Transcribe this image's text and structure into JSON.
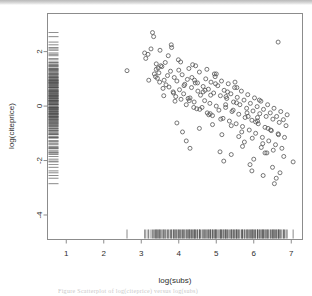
{
  "figure": {
    "kind": "scatterplot-with-rugs",
    "background": "#ffffff",
    "frame_color": "#808080",
    "point_color": "#555555",
    "rug_color": "#4a4a4a",
    "caption_text": "Figure    Scatterplot of log(citeprice) versus log(subs)"
  },
  "chart_data": {
    "type": "scatter",
    "title": "",
    "xlabel": "log(subs)",
    "ylabel": "log(citeprice)",
    "xlim": [
      0.5,
      7.3
    ],
    "ylim": [
      -4.9,
      3.4
    ],
    "xticks": [
      1,
      2,
      3,
      4,
      5,
      6,
      7
    ],
    "xtick_labels": [
      "1",
      "2",
      "3",
      "4",
      "5",
      "6",
      "7"
    ],
    "yticks": [
      2,
      0,
      -2,
      -4
    ],
    "ytick_labels": [
      "2",
      "0",
      "-2",
      "-4"
    ],
    "grid": false,
    "legend": false,
    "marker": "open-circle",
    "marker_size": 3,
    "series": [
      {
        "name": "journals",
        "x": [
          3.3,
          3.4,
          3.52,
          2.62,
          3.09,
          3.18,
          3.33,
          3.35,
          3.38,
          3.4,
          3.43,
          3.47,
          3.49,
          3.55,
          3.61,
          3.64,
          3.66,
          3.7,
          3.74,
          3.78,
          3.81,
          3.85,
          3.88,
          3.92,
          3.95,
          3.99,
          4.02,
          4.06,
          4.09,
          4.13,
          4.16,
          4.2,
          4.23,
          4.27,
          4.3,
          4.34,
          4.37,
          4.41,
          4.44,
          4.48,
          4.51,
          4.55,
          4.58,
          4.62,
          4.65,
          4.69,
          4.72,
          4.76,
          4.79,
          4.83,
          4.86,
          4.9,
          4.93,
          4.97,
          5.0,
          5.04,
          5.07,
          5.11,
          5.14,
          5.18,
          5.21,
          5.25,
          5.28,
          5.32,
          5.35,
          5.39,
          5.42,
          5.46,
          5.49,
          5.53,
          5.56,
          5.6,
          5.63,
          5.67,
          5.7,
          5.74,
          5.77,
          5.81,
          5.84,
          5.88,
          5.91,
          5.95,
          5.98,
          6.02,
          6.05,
          6.09,
          6.12,
          6.16,
          6.19,
          6.23,
          6.26,
          6.3,
          6.33,
          6.37,
          6.4,
          6.44,
          6.47,
          6.51,
          6.54,
          6.58,
          6.61,
          6.65,
          6.68,
          6.72,
          6.75,
          6.79,
          6.82,
          6.86,
          6.89,
          7.05,
          3.12,
          3.26,
          3.45,
          3.58,
          3.72,
          3.86,
          4.0,
          4.14,
          4.28,
          4.42,
          4.56,
          4.7,
          4.84,
          4.98,
          5.12,
          5.26,
          5.4,
          5.54,
          5.68,
          5.82,
          5.96,
          6.1,
          6.24,
          6.38,
          6.52,
          6.66,
          6.8,
          4.05,
          4.35,
          4.65,
          4.95,
          5.25,
          5.55,
          5.85,
          6.15,
          6.45,
          3.95,
          4.25,
          4.55,
          4.85,
          5.15,
          5.45,
          5.75,
          6.05,
          6.35,
          6.65,
          3.2,
          3.6,
          4.1,
          4.5,
          4.9,
          5.3,
          5.7,
          6.1,
          6.5,
          3.8,
          4.4,
          5.0,
          5.6,
          6.2,
          6.7,
          4.2,
          4.8,
          5.4,
          6.0,
          6.6,
          3.5,
          4.3,
          5.1,
          5.9,
          6.55,
          4.45,
          5.2,
          5.95,
          6.3,
          3.9,
          4.75,
          5.5,
          6.25
        ],
        "y": [
          2.7,
          1.55,
          1.48,
          1.3,
          1.95,
          1.9,
          2.55,
          1.18,
          1.08,
          1.35,
          1.02,
          1.22,
          0.88,
          1.45,
          0.95,
          1.6,
          0.78,
          1.12,
          0.7,
          1.28,
          2.15,
          0.52,
          1.05,
          0.35,
          0.92,
          1.7,
          0.6,
          0.25,
          1.15,
          0.45,
          0.8,
          0.05,
          0.98,
          1.38,
          0.3,
          0.68,
          1.52,
          0.15,
          0.85,
          -0.1,
          0.55,
          1.25,
          0.4,
          -0.05,
          0.72,
          0.2,
          1.0,
          -0.25,
          0.62,
          0.1,
          0.88,
          -0.35,
          0.48,
          1.08,
          0.0,
          0.75,
          -0.15,
          0.38,
          0.92,
          -0.45,
          0.58,
          -0.05,
          0.28,
          0.82,
          -0.55,
          0.45,
          -0.2,
          0.15,
          0.68,
          -0.65,
          0.32,
          -0.3,
          0.05,
          0.55,
          -0.75,
          0.22,
          -0.42,
          -0.08,
          0.42,
          -0.88,
          0.1,
          -0.52,
          -0.18,
          0.3,
          -1.0,
          -0.02,
          -0.65,
          -0.28,
          0.18,
          -1.15,
          -0.12,
          -0.78,
          -0.38,
          0.05,
          -1.28,
          -0.25,
          -0.9,
          -0.48,
          -0.08,
          -1.42,
          -0.38,
          -1.02,
          -0.6,
          -0.2,
          -1.55,
          -0.5,
          -1.15,
          -0.72,
          -0.32,
          -2.05,
          1.75,
          2.1,
          1.4,
          0.65,
          1.85,
          0.48,
          1.32,
          0.75,
          0.2,
          0.95,
          -0.12,
          0.58,
          -0.28,
          0.82,
          -0.48,
          0.35,
          -0.72,
          0.12,
          -0.95,
          -0.25,
          -1.18,
          -0.55,
          -1.38,
          -0.82,
          -1.62,
          -1.05,
          -1.85,
          1.62,
          1.05,
          0.52,
          1.18,
          0.05,
          0.68,
          -0.38,
          0.22,
          -0.88,
          -0.62,
          0.28,
          -0.82,
          0.4,
          -1.05,
          -0.15,
          -1.32,
          -0.58,
          -1.72,
          2.35,
          0.95,
          0.38,
          -0.95,
          0.85,
          -0.68,
          0.52,
          -1.48,
          -0.42,
          -2.25,
          2.25,
          -0.05,
          1.18,
          -1.12,
          -1.52,
          -2.45,
          -1.28,
          -0.32,
          -1.78,
          -1.95,
          -2.65,
          2.05,
          -1.55,
          -1.68,
          -2.15,
          -2.85,
          1.48,
          -2.02,
          -2.38,
          -1.72,
          0.18,
          1.35,
          0.88,
          -2.55
        ]
      }
    ],
    "rug_x_label": "log(subs) marginal rug",
    "rug_y_label": "log(citeprice) marginal rug",
    "n_points": 180
  }
}
